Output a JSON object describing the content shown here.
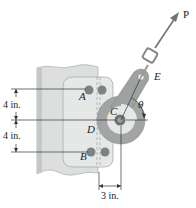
{
  "diagram": {
    "labels": {
      "A": "A",
      "B": "B",
      "C": "C",
      "D": "D",
      "E": "E",
      "P": "P",
      "theta": "θ"
    },
    "dimensions": {
      "upper_vertical": "4 in.",
      "lower_vertical": "4 in.",
      "horizontal": "3 in."
    },
    "colors": {
      "column": "#d9dcdc",
      "column_edge": "#b8bcbc",
      "plate": "#e4e6e5",
      "plate_edge": "#a9adac",
      "lever": "#9c9f9e",
      "rivet": "#7d8180",
      "line": "#333333",
      "arrow": "#6f7372"
    }
  }
}
